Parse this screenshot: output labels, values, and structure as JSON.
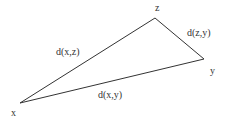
{
  "diagram": {
    "type": "triangle",
    "vertices": {
      "x": {
        "label": "x",
        "pos": [
          20,
          103
        ],
        "label_pos": [
          11,
          108
        ]
      },
      "y": {
        "label": "y",
        "pos": [
          204,
          59
        ],
        "label_pos": [
          210,
          66
        ]
      },
      "z": {
        "label": "z",
        "pos": [
          155,
          18
        ],
        "label_pos": [
          155,
          3
        ]
      }
    },
    "edges": [
      {
        "from": "x",
        "to": "z",
        "label": "d(x,z)",
        "label_pos": [
          56,
          47
        ]
      },
      {
        "from": "z",
        "to": "y",
        "label": "d(z,y)",
        "label_pos": [
          187,
          28
        ]
      },
      {
        "from": "x",
        "to": "y",
        "label": "d(x,y)",
        "label_pos": [
          98,
          90
        ]
      }
    ],
    "stroke_color": "#333333"
  }
}
